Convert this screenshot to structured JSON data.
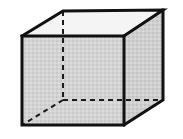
{
  "figure": {
    "shape_name": "cube",
    "canvas": {
      "width": 183,
      "height": 139,
      "background": "#ffffff"
    },
    "style": {
      "front_face_fill": "#d2d2d2",
      "side_face_fill": "#cccccc",
      "top_face_fill": "#f2f2f2",
      "edge_color": "#111111",
      "hidden_edge_color": "#1a1a1a",
      "edge_width": 3,
      "hidden_edge_width": 2,
      "hidden_edge_dash": "5 4"
    },
    "vertices": {
      "front_top_left": [
        22,
        36
      ],
      "front_top_right": [
        124,
        36
      ],
      "front_bottom_left": [
        22,
        125
      ],
      "front_bottom_right": [
        124,
        125
      ],
      "back_top_left": [
        63,
        11
      ],
      "back_top_right": [
        163,
        10
      ],
      "back_bottom_left": [
        63,
        100
      ],
      "back_bottom_right": [
        163,
        100
      ]
    },
    "faces": {
      "front": "22,36 124,36 124,125 22,125",
      "top": "22,36 63,11 163,10 124,36",
      "right": "124,36 163,10 163,100 124,125"
    },
    "visible_edges": [
      "22,36 124,36",
      "124,36 124,125",
      "124,125 22,125",
      "22,125 22,36",
      "22,36 63,11",
      "63,11 163,10",
      "163,10 124,36",
      "163,10 163,100",
      "163,100 124,125"
    ],
    "hidden_edges": [
      "63,11 63,100",
      "63,100 163,100",
      "63,100 22,125"
    ]
  }
}
